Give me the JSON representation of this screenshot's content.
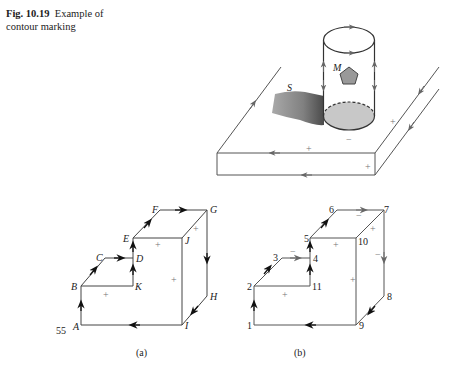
{
  "caption": {
    "figure_number": "Fig. 10.19",
    "title_line1": "Example of",
    "title_line2": "contour marking"
  },
  "top_figure": {
    "labels": {
      "surface": "S",
      "point": "M"
    },
    "signs": {
      "bottom_minus": "−",
      "plate_plus_top": "+",
      "plate_plus_right": "+",
      "plate_plus_front": "+"
    }
  },
  "figure_a": {
    "sublabel": "(a)",
    "vertices": {
      "A": "A",
      "B": "B",
      "C": "C",
      "D": "D",
      "E": "E",
      "F": "F",
      "G": "G",
      "H": "H",
      "I": "I",
      "J": "J",
      "K": "K"
    },
    "corner_number": "55",
    "signs": [
      "+",
      "+",
      "+",
      "+"
    ]
  },
  "figure_b": {
    "sublabel": "(b)",
    "vertices": {
      "v1": "1",
      "v2": "2",
      "v3": "3",
      "v4": "4",
      "v5": "5",
      "v6": "6",
      "v7": "7",
      "v8": "8",
      "v9": "9",
      "v10": "10",
      "v11": "11"
    },
    "signs": {
      "plus": "+",
      "minus": "−"
    }
  },
  "colors": {
    "line_dark": "#222222",
    "line_gray": "#666666",
    "fill_gray": "#bdbdbd",
    "sign_gray": "#777777"
  }
}
